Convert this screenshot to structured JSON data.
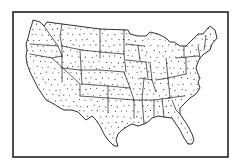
{
  "map": {
    "type": "outline-map",
    "subject": "Contiguous United States with state boundaries, stippled dot fill",
    "labels": [],
    "colors": {
      "background": "#ffffff",
      "ink": "#1a1a1a",
      "frame": "#222222",
      "dots": "#222222"
    },
    "frame": {
      "x": 13,
      "y": 12,
      "width": 215,
      "height": 145,
      "stroke_width": 1.6
    },
    "outline_path": "M33,20 L40,22 L44,26 L47,22 L62,24 L100,29 L128,30 L130,34 L138,36 L146,36 L150,32 L158,34 L166,38 L170,42 L174,42 L180,46 L186,46 L192,40 L198,34 L203,34 L208,28 L210,26 L215,30 L217,38 L212,44 L210,50 L204,54 L200,58 L198,62 L196,68 L198,74 L200,78 L198,82 L200,88 L196,94 L190,98 L184,104 L180,108 L180,114 L184,120 L188,126 L192,134 L194,140 L192,144 L188,144 L184,138 L180,130 L176,124 L172,118 L164,117 L158,116 L152,118 L148,122 L144,124 L138,126 L132,124 L128,126 L122,130 L118,134 L116,140 L118,146 L114,146 L108,140 L104,134 L100,126 L96,120 L92,116 L86,120 L82,116 L78,112 L72,110 L64,110 L60,108 L54,104 L46,100 L42,94 L38,88 L34,80 L30,72 L27,64 L26,56 L27,50 L26,44 L28,38 L30,30 L32,24 Z",
    "state_lines": [
      "M44,26 L58,46 L62,56",
      "M30,44 L58,46",
      "M62,24 L60,36 L62,46",
      "M62,46 L82,50",
      "M62,46 L62,82",
      "M30,54 L52,58 L80,84 L80,96",
      "M52,58 L62,56",
      "M62,68 L80,70",
      "M80,50 L82,84",
      "M82,50 L100,52",
      "M100,29 L100,58",
      "M80,70 L100,70",
      "M100,52 L124,54",
      "M100,70 L124,72",
      "M82,84 L108,86",
      "M108,86 L108,98",
      "M80,96 L108,98 L108,112",
      "M124,30 L124,54",
      "M124,54 L126,72",
      "M124,72 L130,88",
      "M108,86 L130,88",
      "M108,98 L134,100",
      "M126,44 L144,46",
      "M138,46 L140,60",
      "M126,60 L146,62",
      "M146,62 L148,78",
      "M140,78 L152,80",
      "M130,88 L134,100 L134,118",
      "M134,100 L154,100",
      "M144,78 L142,100 L144,124",
      "M154,100 L154,116",
      "M154,100 L170,98",
      "M162,98 L164,117",
      "M150,62 L152,80 L156,92",
      "M156,80 L168,78",
      "M166,58 L168,78 L170,98",
      "M168,78 L186,74",
      "M168,98 L184,96",
      "M172,100 L176,110 L180,114",
      "M186,58 L186,74",
      "M176,58 L198,56",
      "M184,46 L184,58",
      "M198,46 L200,58",
      "M206,36 L204,50"
    ],
    "dot_pattern": {
      "spacing_x": 6,
      "spacing_y": 5.5,
      "offset_row_shift": 3,
      "radius": 0.55,
      "jitter": 1.2
    }
  }
}
